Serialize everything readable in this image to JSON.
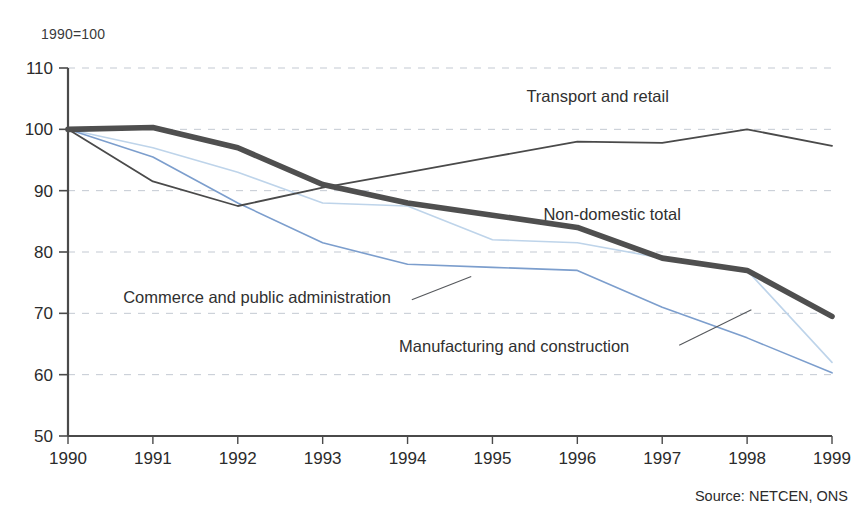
{
  "figure": {
    "unit_note": "1990=100",
    "source_note": "Source: NETCEN, ONS"
  },
  "chart_data": {
    "type": "line",
    "title": "",
    "subtitle": "",
    "xlabel": "",
    "ylabel": "1990=100",
    "x": [
      1990,
      1991,
      1992,
      1993,
      1994,
      1995,
      1996,
      1997,
      1998,
      1999
    ],
    "categories": [
      "1990",
      "1991",
      "1992",
      "1993",
      "1994",
      "1995",
      "1996",
      "1997",
      "1998",
      "1999"
    ],
    "xlim": [
      1990,
      1999
    ],
    "ylim": [
      50,
      110
    ],
    "yticks": [
      50,
      60,
      70,
      80,
      90,
      100,
      110
    ],
    "ytick_labels": [
      "50",
      "60",
      "70",
      "80",
      "90",
      "100",
      "110"
    ],
    "xticks": [
      1990,
      1991,
      1992,
      1993,
      1994,
      1995,
      1996,
      1997,
      1998,
      1999
    ],
    "grid": "horizontal-dashed",
    "legend_position": "inline-annotations",
    "series": [
      {
        "name": "Transport and retail",
        "color": "#4a4a4a",
        "width": 1.8,
        "label_x": 1995.4,
        "label_y": 105.3,
        "values": [
          100.0,
          91.5,
          87.5,
          90.5,
          93.0,
          95.5,
          98.0,
          97.8,
          100.0,
          97.3
        ]
      },
      {
        "name": "Non-domestic total",
        "color": "#4f4f4f",
        "width": 5.6,
        "label_x": 1995.6,
        "label_y": 86.0,
        "values": [
          100.0,
          100.3,
          97.0,
          91.0,
          88.0,
          86.0,
          84.0,
          79.0,
          77.0,
          69.5
        ]
      },
      {
        "name": "Commerce and public administration",
        "color": "#bed4ea",
        "width": 1.6,
        "label_x": 1990.65,
        "label_y": 72.5,
        "values": [
          100.0,
          97.0,
          93.0,
          88.0,
          87.5,
          82.0,
          81.5,
          79.0,
          77.0,
          62.0
        ]
      },
      {
        "name": "Manufacturing and construction",
        "color": "#7c9ecd",
        "width": 1.6,
        "label_x": 1993.9,
        "label_y": 64.5,
        "values": [
          100.0,
          95.5,
          88.0,
          81.5,
          78.0,
          77.5,
          77.0,
          71.0,
          66.0,
          60.3
        ]
      }
    ],
    "annotations": [
      {
        "name": "leader-commerce",
        "from": [
          1994.05,
          72.2
        ],
        "to": [
          1994.75,
          76.0
        ]
      },
      {
        "name": "leader-manufacturing",
        "from": [
          1997.2,
          64.8
        ],
        "to": [
          1998.05,
          70.6
        ]
      }
    ]
  }
}
